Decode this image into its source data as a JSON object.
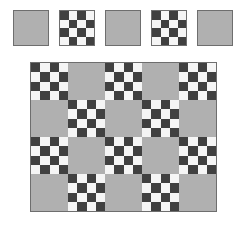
{
  "canvas": {
    "width": 247,
    "height": 233,
    "background": "#ffffff"
  },
  "colors": {
    "tile_gray": "#b0b0b0",
    "checker_dark": "#404040",
    "checker_light": "#f5f5f5",
    "border": "#6e6e6e",
    "background": "#ffffff"
  },
  "tile_types": {
    "plain": "plain-gray-tile",
    "checker": "checkerboard-tile"
  },
  "checker": {
    "rows": 4,
    "cols": 4,
    "start_cell": "dark",
    "description": "4 by 4 alternating dark and light checkerboard, dark square in top-left corner"
  },
  "palette": {
    "label": "tile palette row",
    "tile_size": 36,
    "spacing": 46,
    "left": 13,
    "top": 10,
    "tiles": [
      {
        "index": 0,
        "type": "plain",
        "x": 0
      },
      {
        "index": 1,
        "type": "checker",
        "x": 46
      },
      {
        "index": 2,
        "type": "plain",
        "x": 92
      },
      {
        "index": 3,
        "type": "checker",
        "x": 138
      },
      {
        "index": 4,
        "type": "plain",
        "x": 184
      }
    ]
  },
  "main_grid": {
    "label": "main tiling pattern",
    "left": 30,
    "top": 62,
    "rows": 4,
    "cols": 5,
    "tile_size": 37,
    "pattern": [
      [
        "checker",
        "plain",
        "checker",
        "plain",
        "checker"
      ],
      [
        "plain",
        "checker",
        "plain",
        "checker",
        "plain"
      ],
      [
        "checker",
        "plain",
        "checker",
        "plain",
        "checker"
      ],
      [
        "plain",
        "checker",
        "plain",
        "checker",
        "plain"
      ]
    ]
  }
}
